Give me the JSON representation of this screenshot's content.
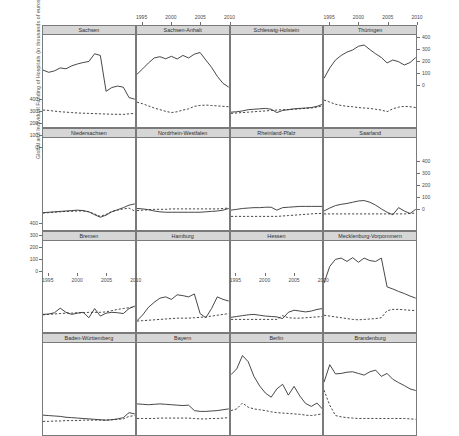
{
  "chart_data": {
    "type": "line",
    "title": "",
    "xlabel": "Years 1994–2010",
    "ylabel": "Global and Individual Funding of Hospitals (in thousands of euros per hospital)",
    "layout": {
      "rows": 4,
      "cols": 4,
      "strip_position": "top",
      "grid": false,
      "legend": "none",
      "alternating_axes": true
    },
    "xlim": [
      1994,
      2010
    ],
    "ylim": [
      -20,
      420
    ],
    "xticks": [
      1995,
      2000,
      2005,
      2010
    ],
    "xtick_labels": [
      "1995",
      "2000",
      "2005",
      "2010"
    ],
    "yticks": [
      0,
      100,
      200,
      300,
      400
    ],
    "ytick_labels": [
      "0",
      "100",
      "200",
      "300",
      "400"
    ],
    "x": [
      1994,
      1995,
      1996,
      1997,
      1998,
      1999,
      2000,
      2001,
      2002,
      2003,
      2004,
      2005,
      2006,
      2007,
      2008,
      2009,
      2010
    ],
    "series_names": [
      "Global funding (solid)",
      "Individual funding (dashed)"
    ],
    "panels": [
      {
        "name": "Sachsen",
        "global": [
          252,
          241,
          248,
          262,
          258,
          272,
          281,
          288,
          293,
          330,
          322,
          150,
          168,
          175,
          170,
          120,
          112
        ],
        "individual": [
          60,
          58,
          55,
          52,
          50,
          48,
          46,
          45,
          44,
          43,
          42,
          41,
          40,
          40,
          39,
          42,
          44
        ]
      },
      {
        "name": "Sachsen-Anhalt",
        "global": [
          232,
          258,
          286,
          310,
          316,
          306,
          318,
          305,
          322,
          310,
          328,
          336,
          300,
          265,
          222,
          188,
          170
        ],
        "individual": [
          98,
          90,
          80,
          70,
          62,
          54,
          48,
          52,
          60,
          66,
          78,
          82,
          84,
          82,
          80,
          78,
          76
        ]
      },
      {
        "name": "Schleswig-Holstein",
        "global": [
          50,
          52,
          56,
          62,
          64,
          66,
          68,
          64,
          48,
          58,
          62,
          66,
          68,
          70,
          72,
          78,
          88
        ],
        "individual": [
          44,
          46,
          48,
          50,
          52,
          54,
          56,
          58,
          60,
          62,
          62,
          64,
          66,
          68,
          70,
          74,
          80
        ]
      },
      {
        "name": "Thüringen",
        "global": [
          212,
          262,
          300,
          322,
          338,
          348,
          366,
          372,
          350,
          330,
          312,
          286,
          300,
          292,
          276,
          288,
          312
        ],
        "individual": [
          108,
          98,
          88,
          82,
          78,
          76,
          72,
          70,
          68,
          64,
          60,
          52,
          66,
          74,
          78,
          76,
          72
        ]
      },
      {
        "name": "Niedersachsen",
        "global": [
          62,
          64,
          66,
          68,
          70,
          72,
          74,
          72,
          66,
          52,
          40,
          50,
          66,
          76,
          86,
          98,
          104
        ],
        "individual": [
          60,
          62,
          64,
          66,
          68,
          68,
          70,
          70,
          66,
          56,
          44,
          54,
          68,
          74,
          80,
          84,
          70
        ]
      },
      {
        "name": "Nordrhein-Westfalen",
        "global": [
          82,
          80,
          76,
          70,
          66,
          64,
          64,
          64,
          64,
          64,
          64,
          64,
          66,
          68,
          70,
          74,
          82
        ],
        "individual": [
          72,
          74,
          76,
          78,
          78,
          78,
          80,
          80,
          80,
          80,
          80,
          80,
          80,
          80,
          80,
          82,
          84
        ]
      },
      {
        "name": "Rheinland-Pfalz",
        "global": [
          74,
          78,
          82,
          84,
          86,
          86,
          88,
          88,
          74,
          86,
          88,
          90,
          92,
          92,
          92,
          92,
          92
        ],
        "individual": [
          44,
          44,
          44,
          44,
          44,
          44,
          44,
          44,
          44,
          46,
          48,
          50,
          52,
          54,
          56,
          58,
          58
        ]
      },
      {
        "name": "Saarland",
        "global": [
          70,
          84,
          96,
          102,
          106,
          112,
          118,
          120,
          112,
          98,
          80,
          64,
          52,
          86,
          70,
          58,
          78
        ],
        "individual": [
          56,
          56,
          56,
          56,
          56,
          56,
          56,
          56,
          56,
          56,
          56,
          56,
          56,
          56,
          56,
          58,
          60
        ]
      },
      {
        "name": "Bremen",
        "global": [
          68,
          70,
          76,
          98,
          78,
          68,
          74,
          78,
          52,
          96,
          60,
          74,
          78,
          76,
          72,
          96,
          108
        ],
        "individual": [
          66,
          68,
          70,
          72,
          74,
          74,
          76,
          76,
          78,
          78,
          78,
          80,
          86,
          92,
          96,
          100,
          104
        ]
      },
      {
        "name": "Hamburg",
        "global": [
          38,
          66,
          102,
          126,
          146,
          152,
          140,
          162,
          158,
          152,
          166,
          72,
          52,
          96,
          152,
          140,
          132
        ],
        "individual": [
          36,
          38,
          40,
          42,
          44,
          46,
          48,
          50,
          50,
          50,
          52,
          54,
          56,
          60,
          64,
          68,
          72
        ]
      },
      {
        "name": "Hessen",
        "global": [
          54,
          58,
          62,
          66,
          68,
          64,
          60,
          58,
          56,
          48,
          78,
          88,
          84,
          80,
          84,
          92,
          96
        ],
        "individual": [
          44,
          44,
          44,
          44,
          44,
          44,
          44,
          44,
          44,
          62,
          52,
          50,
          50,
          52,
          54,
          56,
          58
        ]
      },
      {
        "name": "Mecklenburg-Vorpommern",
        "global": [
          218,
          298,
          332,
          338,
          322,
          340,
          318,
          338,
          326,
          322,
          338,
          200,
          190,
          178,
          168,
          156,
          146
        ],
        "individual": [
          64,
          60,
          56,
          52,
          48,
          44,
          42,
          44,
          46,
          48,
          52,
          86,
          92,
          92,
          90,
          88,
          86
        ]
      },
      {
        "name": "Baden-Württemberg",
        "global": [
          74,
          72,
          70,
          68,
          64,
          62,
          60,
          58,
          56,
          54,
          52,
          50,
          52,
          56,
          62,
          86,
          80
        ],
        "individual": [
          44,
          44,
          46,
          46,
          48,
          48,
          48,
          50,
          50,
          50,
          50,
          50,
          52,
          54,
          56,
          68,
          72
        ]
      },
      {
        "name": "Bayern",
        "global": [
          128,
          126,
          124,
          126,
          128,
          126,
          124,
          122,
          120,
          122,
          96,
          92,
          92,
          94,
          96,
          100,
          104
        ],
        "individual": [
          58,
          58,
          58,
          58,
          60,
          60,
          60,
          60,
          60,
          60,
          58,
          56,
          56,
          58,
          58,
          60,
          62
        ]
      },
      {
        "name": "Berlin",
        "global": [
          268,
          296,
          360,
          330,
          260,
          214,
          180,
          160,
          200,
          222,
          170,
          212,
          166,
          130,
          116,
          132,
          102
        ],
        "individual": [
          96,
          104,
          132,
          112,
          104,
          100,
          96,
          90,
          86,
          84,
          82,
          80,
          78,
          74,
          72,
          76,
          80
        ]
      },
      {
        "name": "Brandenburg",
        "global": [
          232,
          316,
          272,
          274,
          280,
          282,
          274,
          266,
          282,
          290,
          260,
          274,
          246,
          230,
          216,
          200,
          192
        ],
        "individual": [
          194,
          122,
          72,
          66,
          62,
          60,
          58,
          58,
          58,
          58,
          58,
          58,
          58,
          58,
          58,
          56,
          54
        ]
      }
    ]
  }
}
